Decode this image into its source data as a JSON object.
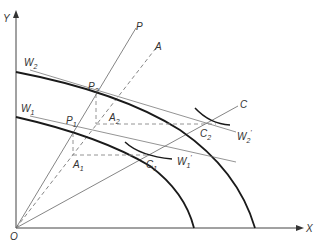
{
  "axes": {
    "x_label": "X",
    "y_label": "Y",
    "origin_label": "O"
  },
  "curves": {
    "w2": {
      "label": "W",
      "sub": "2"
    },
    "w1": {
      "label": "W",
      "sub": "1"
    },
    "w2_prime": {
      "label": "W",
      "sub": "2",
      "sup": "'"
    },
    "w1_prime": {
      "label": "W",
      "sub": "1",
      "sup": "'"
    }
  },
  "rays": {
    "p": "P",
    "a": "A",
    "c": "C"
  },
  "points": {
    "p2": {
      "label": "P",
      "sub": "2"
    },
    "a2": {
      "label": "A",
      "sub": "2"
    },
    "c2": {
      "label": "C",
      "sub": "2"
    },
    "p1": {
      "label": "P",
      "sub": "1"
    },
    "a1": {
      "label": "A",
      "sub": "1"
    },
    "c1": {
      "label": "C",
      "sub": "1"
    }
  },
  "colors": {
    "thick": "#1a1a1a",
    "thin": "#555555",
    "dashed": "#888888"
  }
}
